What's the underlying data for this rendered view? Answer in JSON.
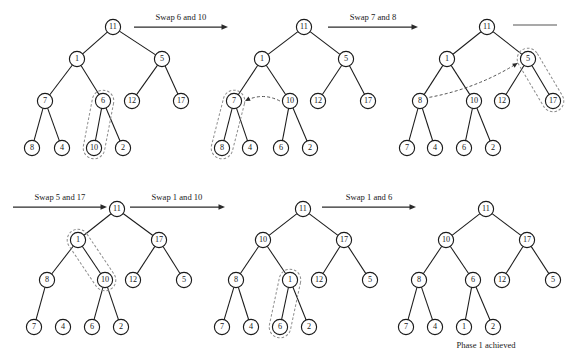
{
  "figure": {
    "caption": "Phase 1 achieved",
    "node_radius": 7.6,
    "trees": [
      {
        "id": "tree-1",
        "name": "tree-step-1",
        "nodes": [
          {
            "id": "n11",
            "label": "11",
            "x": 113,
            "y": 27
          },
          {
            "id": "n1",
            "label": "1",
            "x": 77,
            "y": 59
          },
          {
            "id": "n5",
            "label": "5",
            "x": 162,
            "y": 59
          },
          {
            "id": "n7",
            "label": "7",
            "x": 45,
            "y": 101
          },
          {
            "id": "n6",
            "label": "6",
            "x": 103,
            "y": 101
          },
          {
            "id": "n12",
            "label": "12",
            "x": 132,
            "y": 101
          },
          {
            "id": "n17",
            "label": "17",
            "x": 181,
            "y": 101
          },
          {
            "id": "n8",
            "label": "8",
            "x": 32,
            "y": 148
          },
          {
            "id": "n4",
            "label": "4",
            "x": 62,
            "y": 148
          },
          {
            "id": "n10",
            "label": "10",
            "x": 94,
            "y": 148
          },
          {
            "id": "n2",
            "label": "2",
            "x": 123,
            "y": 148
          }
        ],
        "edges": [
          [
            "n11",
            "n1"
          ],
          [
            "n11",
            "n5"
          ],
          [
            "n1",
            "n7"
          ],
          [
            "n1",
            "n6"
          ],
          [
            "n5",
            "n12"
          ],
          [
            "n5",
            "n17"
          ],
          [
            "n7",
            "n8"
          ],
          [
            "n7",
            "n4"
          ],
          [
            "n6",
            "n10"
          ],
          [
            "n6",
            "n2"
          ]
        ],
        "highlight": {
          "from": "n6",
          "to": "n10",
          "name": "highlight-6-10"
        },
        "pointer": null
      },
      {
        "id": "tree-2",
        "name": "tree-step-2",
        "nodes": [
          {
            "id": "n11",
            "label": "11",
            "x": 304,
            "y": 27
          },
          {
            "id": "n1",
            "label": "1",
            "x": 262,
            "y": 59
          },
          {
            "id": "n5",
            "label": "5",
            "x": 346,
            "y": 59
          },
          {
            "id": "n7",
            "label": "7",
            "x": 234,
            "y": 101
          },
          {
            "id": "n10",
            "label": "10",
            "x": 290,
            "y": 101
          },
          {
            "id": "n12",
            "label": "12",
            "x": 318,
            "y": 101
          },
          {
            "id": "n17",
            "label": "17",
            "x": 368,
            "y": 101
          },
          {
            "id": "n8",
            "label": "8",
            "x": 222,
            "y": 148
          },
          {
            "id": "n4",
            "label": "4",
            "x": 250,
            "y": 148
          },
          {
            "id": "n6",
            "label": "6",
            "x": 281,
            "y": 148
          },
          {
            "id": "n2",
            "label": "2",
            "x": 310,
            "y": 148
          }
        ],
        "edges": [
          [
            "n11",
            "n1"
          ],
          [
            "n11",
            "n5"
          ],
          [
            "n1",
            "n7"
          ],
          [
            "n1",
            "n10"
          ],
          [
            "n5",
            "n12"
          ],
          [
            "n5",
            "n17"
          ],
          [
            "n7",
            "n8"
          ],
          [
            "n7",
            "n4"
          ],
          [
            "n10",
            "n6"
          ],
          [
            "n10",
            "n2"
          ]
        ],
        "highlight": {
          "from": "n7",
          "to": "n8",
          "name": "highlight-7-8"
        },
        "pointer": {
          "from": "n10",
          "to": "n7",
          "name": "swap-pointer-10-to-7"
        }
      },
      {
        "id": "tree-3",
        "name": "tree-step-3",
        "nodes": [
          {
            "id": "n11",
            "label": "11",
            "x": 487,
            "y": 27
          },
          {
            "id": "n1",
            "label": "1",
            "x": 447,
            "y": 59
          },
          {
            "id": "n5",
            "label": "5",
            "x": 528,
            "y": 59
          },
          {
            "id": "n8",
            "label": "8",
            "x": 420,
            "y": 101
          },
          {
            "id": "n10",
            "label": "10",
            "x": 474,
            "y": 101
          },
          {
            "id": "n12",
            "label": "12",
            "x": 502,
            "y": 101
          },
          {
            "id": "n17",
            "label": "17",
            "x": 553,
            "y": 101
          },
          {
            "id": "n7",
            "label": "7",
            "x": 407,
            "y": 148
          },
          {
            "id": "n4",
            "label": "4",
            "x": 435,
            "y": 148
          },
          {
            "id": "n6",
            "label": "6",
            "x": 464,
            "y": 148
          },
          {
            "id": "n2",
            "label": "2",
            "x": 493,
            "y": 148
          }
        ],
        "edges": [
          [
            "n11",
            "n1"
          ],
          [
            "n11",
            "n5"
          ],
          [
            "n1",
            "n8"
          ],
          [
            "n1",
            "n10"
          ],
          [
            "n5",
            "n12"
          ],
          [
            "n5",
            "n17"
          ],
          [
            "n8",
            "n7"
          ],
          [
            "n8",
            "n4"
          ],
          [
            "n10",
            "n6"
          ],
          [
            "n10",
            "n2"
          ]
        ],
        "highlight": {
          "from": "n5",
          "to": "n17",
          "name": "highlight-5-17"
        },
        "pointer": {
          "from": "n8",
          "to": "n5",
          "name": "swap-pointer-8-to-5"
        }
      },
      {
        "id": "tree-4",
        "name": "tree-step-4",
        "nodes": [
          {
            "id": "n11",
            "label": "11",
            "x": 117,
            "y": 209
          },
          {
            "id": "n1",
            "label": "1",
            "x": 78,
            "y": 240
          },
          {
            "id": "n17",
            "label": "17",
            "x": 159,
            "y": 240
          },
          {
            "id": "n8",
            "label": "8",
            "x": 47,
            "y": 280
          },
          {
            "id": "n10",
            "label": "10",
            "x": 105,
            "y": 280
          },
          {
            "id": "n12",
            "label": "12",
            "x": 133,
            "y": 280
          },
          {
            "id": "n5",
            "label": "5",
            "x": 184,
            "y": 280
          },
          {
            "id": "n7",
            "label": "7",
            "x": 34,
            "y": 327
          },
          {
            "id": "n4",
            "label": "4",
            "x": 63,
            "y": 327
          },
          {
            "id": "n6",
            "label": "6",
            "x": 92,
            "y": 327
          },
          {
            "id": "n2",
            "label": "2",
            "x": 121,
            "y": 327
          }
        ],
        "edges": [
          [
            "n11",
            "n1"
          ],
          [
            "n11",
            "n17"
          ],
          [
            "n1",
            "n8"
          ],
          [
            "n1",
            "n10"
          ],
          [
            "n17",
            "n12"
          ],
          [
            "n17",
            "n5"
          ],
          [
            "n8",
            "n7"
          ],
          [
            "n10",
            "n6"
          ],
          [
            "n10",
            "n2"
          ]
        ],
        "highlight": {
          "from": "n1",
          "to": "n10",
          "name": "highlight-1-10"
        },
        "pointer": null
      },
      {
        "id": "tree-5",
        "name": "tree-step-5",
        "nodes": [
          {
            "id": "n11",
            "label": "11",
            "x": 303,
            "y": 209
          },
          {
            "id": "n10",
            "label": "10",
            "x": 263,
            "y": 240
          },
          {
            "id": "n17",
            "label": "17",
            "x": 344,
            "y": 240
          },
          {
            "id": "n8",
            "label": "8",
            "x": 236,
            "y": 280
          },
          {
            "id": "n1",
            "label": "1",
            "x": 290,
            "y": 280
          },
          {
            "id": "n12",
            "label": "12",
            "x": 319,
            "y": 280
          },
          {
            "id": "n5",
            "label": "5",
            "x": 370,
            "y": 280
          },
          {
            "id": "n7",
            "label": "7",
            "x": 222,
            "y": 327
          },
          {
            "id": "n4",
            "label": "4",
            "x": 251,
            "y": 327
          },
          {
            "id": "n6",
            "label": "6",
            "x": 280,
            "y": 327
          },
          {
            "id": "n2",
            "label": "2",
            "x": 309,
            "y": 327
          }
        ],
        "edges": [
          [
            "n11",
            "n10"
          ],
          [
            "n11",
            "n17"
          ],
          [
            "n10",
            "n8"
          ],
          [
            "n10",
            "n1"
          ],
          [
            "n17",
            "n12"
          ],
          [
            "n17",
            "n5"
          ],
          [
            "n8",
            "n7"
          ],
          [
            "n8",
            "n4"
          ],
          [
            "n1",
            "n6"
          ],
          [
            "n1",
            "n2"
          ]
        ],
        "highlight": {
          "from": "n1",
          "to": "n6",
          "name": "highlight-1-6"
        },
        "pointer": null
      },
      {
        "id": "tree-6",
        "name": "tree-step-6-final",
        "nodes": [
          {
            "id": "n11",
            "label": "11",
            "x": 486,
            "y": 209
          },
          {
            "id": "n10",
            "label": "10",
            "x": 446,
            "y": 240
          },
          {
            "id": "n17",
            "label": "17",
            "x": 527,
            "y": 240
          },
          {
            "id": "n8",
            "label": "8",
            "x": 419,
            "y": 280
          },
          {
            "id": "n6",
            "label": "6",
            "x": 473,
            "y": 280
          },
          {
            "id": "n12",
            "label": "12",
            "x": 502,
            "y": 280
          },
          {
            "id": "n5",
            "label": "5",
            "x": 553,
            "y": 280
          },
          {
            "id": "n7",
            "label": "7",
            "x": 406,
            "y": 327
          },
          {
            "id": "n4",
            "label": "4",
            "x": 435,
            "y": 327
          },
          {
            "id": "n1",
            "label": "1",
            "x": 464,
            "y": 327
          },
          {
            "id": "n2",
            "label": "2",
            "x": 493,
            "y": 327
          }
        ],
        "edges": [
          [
            "n11",
            "n10"
          ],
          [
            "n11",
            "n17"
          ],
          [
            "n10",
            "n8"
          ],
          [
            "n10",
            "n6"
          ],
          [
            "n17",
            "n12"
          ],
          [
            "n17",
            "n5"
          ],
          [
            "n8",
            "n7"
          ],
          [
            "n8",
            "n4"
          ],
          [
            "n6",
            "n1"
          ],
          [
            "n6",
            "n2"
          ]
        ],
        "highlight": null,
        "pointer": null
      }
    ],
    "arrows": [
      {
        "id": "arrow-1",
        "name": "swap-arrow-6-and-10",
        "label": "Swap 6 and 10",
        "x1": 134,
        "y1": 27,
        "x2": 228,
        "y2": 27,
        "label_x": 181,
        "label_y": 20
      },
      {
        "id": "arrow-2",
        "name": "swap-arrow-7-and-8",
        "label": "Swap 7 and 8",
        "x1": 328,
        "y1": 27,
        "x2": 418,
        "y2": 27,
        "label_x": 373,
        "label_y": 20
      },
      {
        "id": "arrow-3",
        "name": "swap-arrow-5-and-17",
        "label": "Swap 5 and 17",
        "x1": 13,
        "y1": 207,
        "x2": 107,
        "y2": 207,
        "label_x": 60,
        "label_y": 200
      },
      {
        "id": "arrow-4",
        "name": "swap-arrow-1-and-10",
        "label": "Swap 1 and 10",
        "x1": 130,
        "y1": 207,
        "x2": 225,
        "y2": 207,
        "label_x": 177,
        "label_y": 200
      },
      {
        "id": "arrow-5",
        "name": "swap-arrow-1-and-6",
        "label": "Swap 1 and 6",
        "x1": 322,
        "y1": 207,
        "x2": 416,
        "y2": 207,
        "label_x": 369,
        "label_y": 200
      }
    ],
    "stub": {
      "id": "stub-line",
      "name": "truncated-arrow-stub",
      "x1": 513,
      "y1": 25,
      "x2": 557,
      "y2": 25
    },
    "caption_pos": {
      "x": 486,
      "y": 348
    }
  }
}
